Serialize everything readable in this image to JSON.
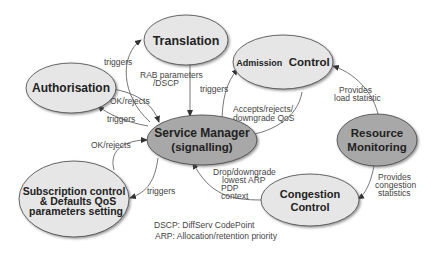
{
  "diagram": {
    "nodes": [
      {
        "id": "translation",
        "label": "Translation",
        "fill": "#e6e6e6"
      },
      {
        "id": "authorisation",
        "label": "Authorisation",
        "fill": "#e6e6e6"
      },
      {
        "id": "admission_control",
        "label_small": "Admission",
        "label_large": "Control",
        "fill": "#e6e6e6"
      },
      {
        "id": "service_manager",
        "line1": "Service Manager",
        "line2": "(signalling)",
        "fill": "#a8a8a8"
      },
      {
        "id": "resource_monitoring",
        "line1": "Resource",
        "line2": "Monitoring",
        "fill": "#a8a8a8"
      },
      {
        "id": "subscription_control",
        "line1": "Subscription control",
        "line2": "& Defaults QoS",
        "line3": "parameters setting",
        "fill": "#e6e6e6"
      },
      {
        "id": "congestion_control",
        "line1": "Congestion",
        "line2": "Control",
        "fill": "#e6e6e6"
      }
    ],
    "edges": [
      {
        "from": "service_manager",
        "to": "translation",
        "label": "triggers"
      },
      {
        "from": "translation",
        "to": "service_manager",
        "label_line1": "RAB parameters",
        "label_line2": "/DSCP"
      },
      {
        "from": "authorisation",
        "to": "service_manager",
        "label": "OK/rejects"
      },
      {
        "from": "service_manager",
        "to": "authorisation",
        "label": "triggers"
      },
      {
        "from": "service_manager",
        "to": "admission_control",
        "label": "triggers"
      },
      {
        "from": "admission_control",
        "to": "service_manager",
        "label_line1": "Accepts/rejects/",
        "label_line2": "downgrade QoS"
      },
      {
        "from": "resource_monitoring",
        "to": "admission_control",
        "label_line1": "Provides",
        "label_line2": "load statistic"
      },
      {
        "from": "subscription_control",
        "to": "service_manager",
        "label": "OK/rejects"
      },
      {
        "from": "service_manager",
        "to": "subscription_control",
        "label": "triggers"
      },
      {
        "from": "congestion_control",
        "to": "service_manager",
        "label_line1": "Drop/downgrade",
        "label_line2": "lowest ARP",
        "label_line3": "PDP",
        "label_line4": "context"
      },
      {
        "from": "resource_monitoring",
        "to": "congestion_control",
        "label_line1": "Provides",
        "label_line2": "congestion",
        "label_line3": "statistics"
      }
    ],
    "legend": [
      "DSCP: DiffServ CodePoint",
      "ARP: Allocation/retention priority"
    ]
  }
}
